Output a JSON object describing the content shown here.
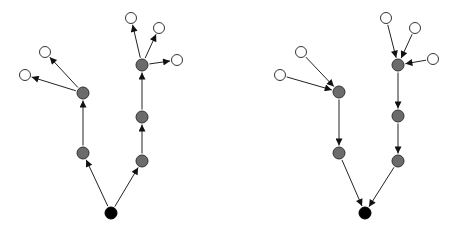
{
  "diagram": {
    "background": "#ffffff",
    "colors": {
      "root": "#000000",
      "internal": "#6b6b6b",
      "leaf": "#ffffff",
      "stroke": "#333333",
      "edge": "#222222"
    },
    "graphs": [
      {
        "name": "outgoing-tree",
        "direction": "away-from-root",
        "nodes": [
          {
            "id": "r",
            "type": "root",
            "x": 111,
            "y": 213
          },
          {
            "id": "a1",
            "type": "internal",
            "x": 83,
            "y": 153
          },
          {
            "id": "a2",
            "type": "internal",
            "x": 83,
            "y": 93
          },
          {
            "id": "a3",
            "type": "leaf",
            "x": 45,
            "y": 52
          },
          {
            "id": "a4",
            "type": "leaf",
            "x": 25,
            "y": 75
          },
          {
            "id": "b1",
            "type": "internal",
            "x": 142,
            "y": 161
          },
          {
            "id": "b2",
            "type": "internal",
            "x": 142,
            "y": 117
          },
          {
            "id": "b3",
            "type": "internal",
            "x": 142,
            "y": 65
          },
          {
            "id": "b4",
            "type": "leaf",
            "x": 131,
            "y": 18
          },
          {
            "id": "b5",
            "type": "leaf",
            "x": 159,
            "y": 28
          },
          {
            "id": "b6",
            "type": "leaf",
            "x": 177,
            "y": 60
          }
        ],
        "edges": [
          [
            "r",
            "a1"
          ],
          [
            "a1",
            "a2"
          ],
          [
            "a2",
            "a3"
          ],
          [
            "a2",
            "a4"
          ],
          [
            "r",
            "b1"
          ],
          [
            "b1",
            "b2"
          ],
          [
            "b2",
            "b3"
          ],
          [
            "b3",
            "b4"
          ],
          [
            "b3",
            "b5"
          ],
          [
            "b3",
            "b6"
          ]
        ]
      },
      {
        "name": "incoming-tree",
        "direction": "toward-root",
        "nodes": [
          {
            "id": "r",
            "type": "root",
            "x": 365,
            "y": 213
          },
          {
            "id": "a1",
            "type": "internal",
            "x": 339,
            "y": 153
          },
          {
            "id": "a2",
            "type": "internal",
            "x": 339,
            "y": 92
          },
          {
            "id": "a3",
            "type": "leaf",
            "x": 301,
            "y": 52
          },
          {
            "id": "a4",
            "type": "leaf",
            "x": 280,
            "y": 75
          },
          {
            "id": "b1",
            "type": "internal",
            "x": 398,
            "y": 161
          },
          {
            "id": "b2",
            "type": "internal",
            "x": 398,
            "y": 116
          },
          {
            "id": "b3",
            "type": "internal",
            "x": 398,
            "y": 65
          },
          {
            "id": "b4",
            "type": "leaf",
            "x": 386,
            "y": 18
          },
          {
            "id": "b5",
            "type": "leaf",
            "x": 415,
            "y": 28
          },
          {
            "id": "b6",
            "type": "leaf",
            "x": 433,
            "y": 59
          }
        ],
        "edges": [
          [
            "a1",
            "r"
          ],
          [
            "a2",
            "a1"
          ],
          [
            "a3",
            "a2"
          ],
          [
            "a4",
            "a2"
          ],
          [
            "b1",
            "r"
          ],
          [
            "b2",
            "b1"
          ],
          [
            "b3",
            "b2"
          ],
          [
            "b4",
            "b3"
          ],
          [
            "b5",
            "b3"
          ],
          [
            "b6",
            "b3"
          ]
        ]
      }
    ]
  }
}
